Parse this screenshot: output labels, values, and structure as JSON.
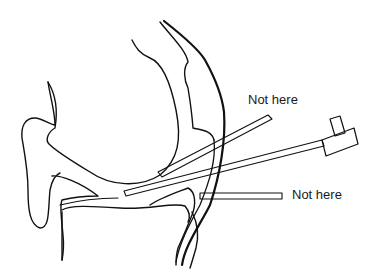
{
  "diagram": {
    "type": "anatomical line drawing",
    "labels": {
      "top": "Not here",
      "bottom": "Not here"
    },
    "colors": {
      "stroke": "#111111",
      "background": "#ffffff"
    }
  }
}
